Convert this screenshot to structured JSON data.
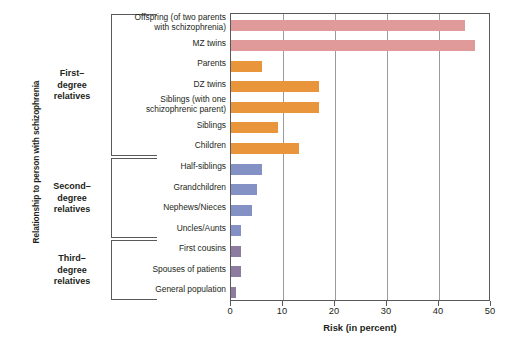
{
  "chart_data": {
    "type": "bar",
    "orientation": "horizontal",
    "title": "",
    "xlabel": "Risk (in percent)",
    "ylabel": "Relationship to person with schizophrenia",
    "xlim": [
      0,
      50
    ],
    "xticks": [
      0,
      10,
      20,
      30,
      40,
      50
    ],
    "grid": "vertical",
    "legend": "none",
    "categories": [
      "Offspring (of two parents\nwith schizophrenia)",
      "MZ twins",
      "Parents",
      "DZ twins",
      "Siblings (with one\nschizophrenic parent)",
      "Siblings",
      "Children",
      "Half-siblings",
      "Grandchildren",
      "Nephews/Nieces",
      "Uncles/Aunts",
      "First cousins",
      "Spouses  of patients",
      "General population"
    ],
    "values": [
      45,
      47,
      6,
      17,
      17,
      9,
      13,
      6,
      5,
      4,
      2,
      2,
      2,
      1
    ],
    "bar_colors": [
      "#e09a9a",
      "#e09a9a",
      "#e8953c",
      "#e8953c",
      "#e8953c",
      "#e8953c",
      "#e8953c",
      "#8491c4",
      "#8491c4",
      "#8491c4",
      "#8491c4",
      "#8d7ba0",
      "#8d7ba0",
      "#8d7ba0"
    ],
    "groups": [
      {
        "label": "First–\ndegree\nrelatives",
        "from": 0,
        "to": 6
      },
      {
        "label": "Second–\ndegree\nrelatives",
        "from": 7,
        "to": 10
      },
      {
        "label": "Third–\ndegree\nrelatives",
        "from": 11,
        "to": 13
      }
    ]
  },
  "axis": {
    "x_title": "Risk (in percent)",
    "y_title": "Relationship to person with schizophrenia",
    "x_tick_labels": [
      "0",
      "10",
      "20",
      "30",
      "40",
      "50"
    ]
  },
  "groups": [
    {
      "line1": "First–",
      "line2": "degree",
      "line3": "relatives"
    },
    {
      "line1": "Second–",
      "line2": "degree",
      "line3": "relatives"
    },
    {
      "line1": "Third–",
      "line2": "degree",
      "line3": "relatives"
    }
  ],
  "colors": {
    "pink": "#e09a9a",
    "orange": "#e8953c",
    "blue": "#8491c4",
    "purple": "#8d7ba0",
    "axis": "#58595b",
    "grid": "#9a9b9e",
    "text": "#231f20"
  }
}
